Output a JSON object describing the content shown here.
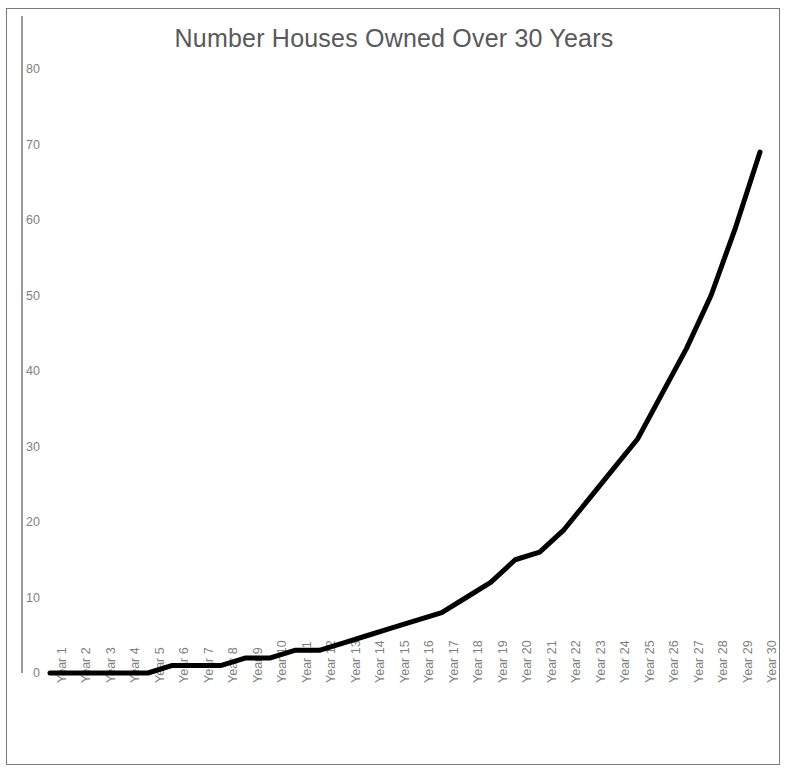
{
  "chart_data": {
    "type": "line",
    "title": "Number Houses Owned Over 30 Years",
    "xlabel": "",
    "ylabel": "",
    "ylim": [
      0,
      80
    ],
    "yticks": [
      0,
      10,
      20,
      30,
      40,
      50,
      60,
      70,
      80
    ],
    "grid": false,
    "legend": false,
    "legend_position": "none",
    "line_color": "#000000",
    "line_width": 5,
    "categories": [
      "Year 1",
      "Year 2",
      "Year 3",
      "Year 4",
      "Year 5",
      "Year 6",
      "Year 7",
      "Year 8",
      "Year 9",
      "Year 10",
      "Year 11",
      "Year 12",
      "Year 13",
      "Year 14",
      "Year 15",
      "Year 16",
      "Year 17",
      "Year 18",
      "Year 19",
      "Year 20",
      "Year 21",
      "Year 22",
      "Year 23",
      "Year 24",
      "Year 25",
      "Year 26",
      "Year 27",
      "Year 28",
      "Year 29",
      "Year 30"
    ],
    "values": [
      0,
      0,
      0,
      0,
      0,
      1,
      1,
      1,
      2,
      2,
      3,
      3,
      4,
      5,
      6,
      7,
      8,
      10,
      12,
      15,
      16,
      19,
      23,
      27,
      31,
      37,
      43,
      50,
      59,
      69
    ],
    "series": [
      {
        "name": "Houses Owned",
        "values": [
          0,
          0,
          0,
          0,
          0,
          1,
          1,
          1,
          2,
          2,
          3,
          3,
          4,
          5,
          6,
          7,
          8,
          10,
          12,
          15,
          16,
          19,
          23,
          27,
          31,
          37,
          43,
          50,
          59,
          69
        ]
      }
    ]
  },
  "colors": {
    "title_text": "#595959",
    "tick_text": "#7f7f7f",
    "axis": "#9a9a9a",
    "frame_border": "#7a7a7a",
    "background": "#ffffff",
    "line": "#000000"
  }
}
